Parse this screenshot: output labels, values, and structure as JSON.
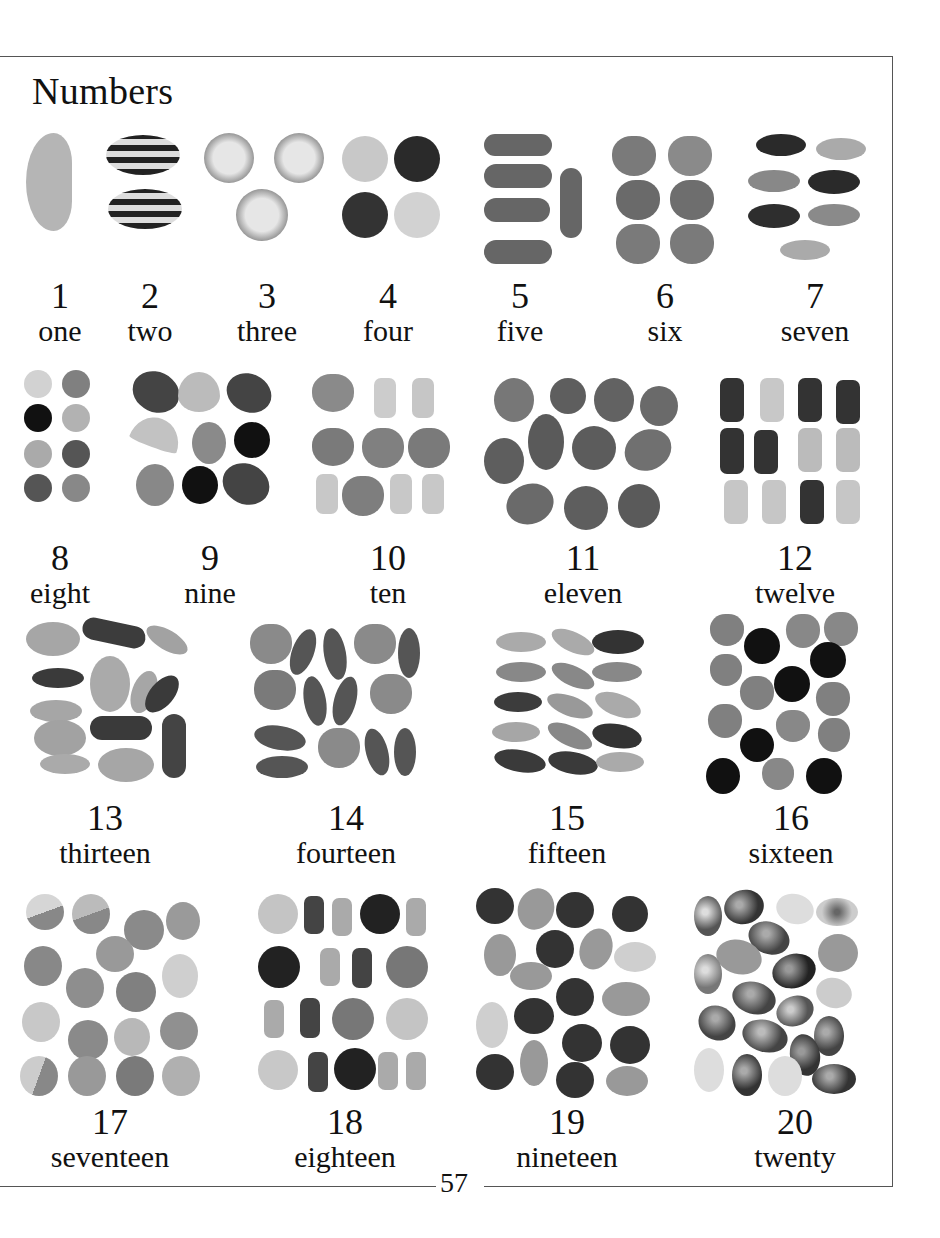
{
  "page": {
    "title": "Numbers",
    "page_number": "57"
  },
  "items": [
    {
      "number": "1",
      "word": "one"
    },
    {
      "number": "2",
      "word": "two"
    },
    {
      "number": "3",
      "word": "three"
    },
    {
      "number": "4",
      "word": "four"
    },
    {
      "number": "5",
      "word": "five"
    },
    {
      "number": "6",
      "word": "six"
    },
    {
      "number": "7",
      "word": "seven"
    },
    {
      "number": "8",
      "word": "eight"
    },
    {
      "number": "9",
      "word": "nine"
    },
    {
      "number": "10",
      "word": "ten"
    },
    {
      "number": "11",
      "word": "eleven"
    },
    {
      "number": "12",
      "word": "twelve"
    },
    {
      "number": "13",
      "word": "thirteen"
    },
    {
      "number": "14",
      "word": "fourteen"
    },
    {
      "number": "15",
      "word": "fifteen"
    },
    {
      "number": "16",
      "word": "sixteen"
    },
    {
      "number": "17",
      "word": "seventeen"
    },
    {
      "number": "18",
      "word": "eighteen"
    },
    {
      "number": "19",
      "word": "nineteen"
    },
    {
      "number": "20",
      "word": "twenty"
    }
  ],
  "illustrations": [
    {
      "count": 1,
      "subject": "sugared jelly slice"
    },
    {
      "count": 2,
      "subject": "striped humbugs"
    },
    {
      "count": 3,
      "subject": "coconut candies"
    },
    {
      "count": 4,
      "subject": "round sweets"
    },
    {
      "count": 5,
      "subject": "capsule sweets"
    },
    {
      "count": 6,
      "subject": "sugared jelly hearts"
    },
    {
      "count": 7,
      "subject": "jelly beans"
    },
    {
      "count": 8,
      "subject": "chocolate buttons"
    },
    {
      "count": 9,
      "subject": "mixed fruit jellies"
    },
    {
      "count": 10,
      "subject": "jelly hearts and gummy bears"
    },
    {
      "count": 11,
      "subject": "fruit gums"
    },
    {
      "count": 12,
      "subject": "gummy bears"
    },
    {
      "count": 13,
      "subject": "mixed jelly sweets"
    },
    {
      "count": 14,
      "subject": "jelly beans and hearts"
    },
    {
      "count": 15,
      "subject": "jelly beans"
    },
    {
      "count": 16,
      "subject": "jelly hearts and liquorice drops"
    },
    {
      "count": 17,
      "subject": "sugared gum drops"
    },
    {
      "count": 18,
      "subject": "buttons and gummy bears"
    },
    {
      "count": 19,
      "subject": "sugared almonds and raspberry drops"
    },
    {
      "count": 20,
      "subject": "foil eggs and sugared almonds"
    }
  ],
  "colors": {
    "frame_line": "#555555",
    "dark": "#2a2a2a",
    "mid": "#6e6e6e",
    "light": "#a8a8a8",
    "pale": "#cfcfcf"
  }
}
